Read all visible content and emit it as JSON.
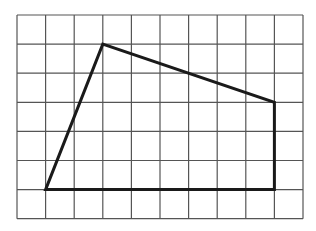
{
  "figure": {
    "type": "grid-polygon",
    "grid": {
      "columns": 10,
      "rows": 7,
      "origin_px": [
        17,
        15
      ],
      "cell_px": [
        28.6,
        29.1
      ],
      "line_color": "#555555"
    },
    "polygon": {
      "shape": "quadrilateral",
      "stroke_color": "#1a1a1a",
      "vertices_grid": [
        [
          1,
          6
        ],
        [
          3,
          1
        ],
        [
          9,
          3
        ],
        [
          9,
          6
        ]
      ]
    }
  }
}
